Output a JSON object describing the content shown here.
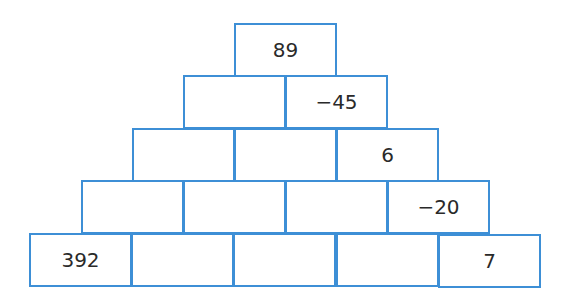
{
  "puzzle": {
    "type": "number-pyramid",
    "border_color": "#3d8fd6",
    "rows": [
      {
        "row": 1,
        "cells": [
          "89"
        ]
      },
      {
        "row": 2,
        "cells": [
          "",
          "−45"
        ]
      },
      {
        "row": 3,
        "cells": [
          "",
          "",
          "6"
        ]
      },
      {
        "row": 4,
        "cells": [
          "",
          "",
          "",
          "−20"
        ]
      },
      {
        "row": 5,
        "cells": [
          "392",
          "",
          "",
          "",
          "7"
        ]
      }
    ]
  }
}
